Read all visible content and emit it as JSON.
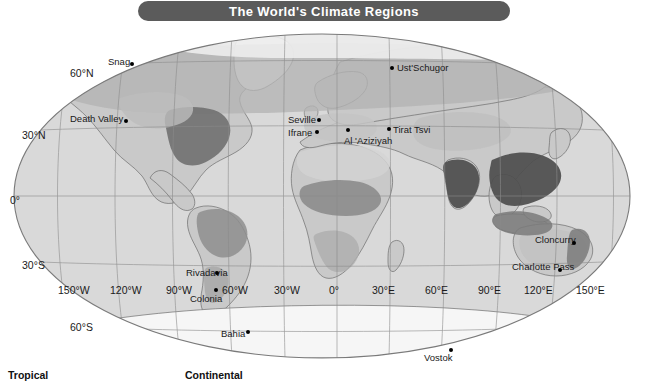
{
  "title": {
    "text": "The World's Climate Regions"
  },
  "map": {
    "projection": "elliptical",
    "background_color": "#ffffff",
    "ocean_color": "#d8d8d8",
    "land_color": "#c9c9c9",
    "highland_color": "#b0b0b0",
    "tropical_color": "#8f8f8f",
    "dark_zone_color": "#4a4a4a",
    "ice_color": "#f4f4f4",
    "graticule_color": "#8d8d8d",
    "coastline_color": "#6e6e6e"
  },
  "graticule": {
    "latitudes": [
      {
        "label": "60°N",
        "x": 70,
        "y": 68
      },
      {
        "label": "30°N",
        "x": 22,
        "y": 130
      },
      {
        "label": "0°",
        "x": 10,
        "y": 195
      },
      {
        "label": "30°S",
        "x": 22,
        "y": 260
      },
      {
        "label": "60°S",
        "x": 70,
        "y": 322
      }
    ],
    "longitudes": [
      {
        "label": "150°W",
        "x": 58,
        "y": 285
      },
      {
        "label": "120°W",
        "x": 110,
        "y": 285
      },
      {
        "label": "90°W",
        "x": 166,
        "y": 285
      },
      {
        "label": "60°W",
        "x": 222,
        "y": 285
      },
      {
        "label": "30°W",
        "x": 274,
        "y": 285
      },
      {
        "label": "0°",
        "x": 329,
        "y": 285
      },
      {
        "label": "30°E",
        "x": 372,
        "y": 285
      },
      {
        "label": "60°E",
        "x": 425,
        "y": 285
      },
      {
        "label": "90°E",
        "x": 478,
        "y": 285
      },
      {
        "label": "120°E",
        "x": 524,
        "y": 285
      },
      {
        "label": "150°E",
        "x": 576,
        "y": 285
      }
    ]
  },
  "cities": [
    {
      "name": "Snag",
      "label_x": 108,
      "label_y": 57,
      "dot_x": 130,
      "dot_y": 62
    },
    {
      "name": "Death Valley",
      "label_x": 70,
      "label_y": 114,
      "dot_x": 124,
      "dot_y": 119
    },
    {
      "name": "Ust'Schugor",
      "label_x": 397,
      "label_y": 63,
      "dot_x": 390,
      "dot_y": 66
    },
    {
      "name": "Seville",
      "label_x": 288,
      "label_y": 115,
      "dot_x": 317,
      "dot_y": 118
    },
    {
      "name": "Ifrane",
      "label_x": 288,
      "label_y": 128,
      "dot_x": 315,
      "dot_y": 130
    },
    {
      "name": "Al 'Aziziyah",
      "label_x": 344,
      "label_y": 136,
      "dot_x": 346,
      "dot_y": 128
    },
    {
      "name": "Tirat Tsvi",
      "label_x": 393,
      "label_y": 125,
      "dot_x": 387,
      "dot_y": 127
    },
    {
      "name": "Rivadavia",
      "label_x": 186,
      "label_y": 268,
      "dot_x": 215,
      "dot_y": 271
    },
    {
      "name": "Colonia",
      "label_x": 190,
      "label_y": 294,
      "dot_x": 214,
      "dot_y": 288
    },
    {
      "name": "Bahia",
      "label_x": 221,
      "label_y": 329,
      "dot_x": 246,
      "dot_y": 330
    },
    {
      "name": "Cloncurry",
      "label_x": 535,
      "label_y": 235,
      "dot_x": 572,
      "dot_y": 241
    },
    {
      "name": "Charlotte Pass",
      "label_x": 512,
      "label_y": 262,
      "dot_x": 558,
      "dot_y": 268
    },
    {
      "name": "Vostok",
      "label_x": 424,
      "label_y": 353,
      "dot_x": 449,
      "dot_y": 348
    }
  ],
  "legend": {
    "items": [
      {
        "label": "Tropical",
        "x": 8
      },
      {
        "label": "Continental",
        "x": 185
      }
    ]
  }
}
